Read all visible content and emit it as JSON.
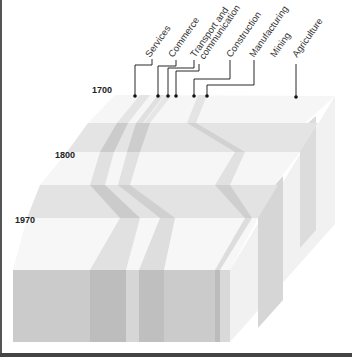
{
  "diagram": {
    "type": "isometric layered block diagram",
    "years": [
      {
        "label": "1700"
      },
      {
        "label": "1800"
      },
      {
        "label": "1970"
      }
    ],
    "sectors": [
      {
        "label": "Services"
      },
      {
        "label": "Commerce"
      },
      {
        "label": "Transport and"
      },
      {
        "label": "communication"
      },
      {
        "label": "Construction"
      },
      {
        "label": "Manufacturing"
      },
      {
        "label": "Mining"
      },
      {
        "label": "Agriculture"
      }
    ],
    "colors": {
      "face_light": "#f6f6f6",
      "face_mid": "#e2e2e2",
      "face_band": "#cfcfcf",
      "front_face": "#c8c8c8",
      "front_band": "#b9b9b9",
      "side_face": "#eaeaea",
      "leader": "#111111"
    }
  }
}
